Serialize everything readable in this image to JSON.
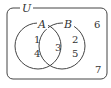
{
  "diagram": {
    "type": "venn",
    "universe_label": "U",
    "sets": [
      {
        "name": "A",
        "label": "A"
      },
      {
        "name": "B",
        "label": "B"
      }
    ],
    "regions": {
      "a_only": [
        "1",
        "4"
      ],
      "a_and_b": [
        "3"
      ],
      "b_only": [
        "2",
        "5"
      ],
      "outside": [
        "6",
        "7"
      ]
    },
    "line_color": "#444444"
  }
}
